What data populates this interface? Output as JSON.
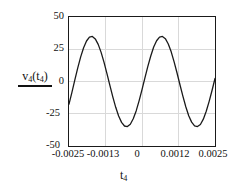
{
  "chart_data": {
    "type": "line",
    "title": "",
    "subtitle": "",
    "xlabel": "t_4",
    "ylabel": "v_4(t_4)",
    "xlabel_parts": {
      "base": "t",
      "sub": "4"
    },
    "ylabel_parts": {
      "base": "v",
      "sub": "4",
      "arg_base": "t",
      "arg_sub": "4"
    },
    "xlim": [
      -0.0025,
      0.0025
    ],
    "ylim": [
      -50,
      50
    ],
    "xticks": [
      -0.0025,
      -0.0013,
      0,
      0.0012,
      0.0025
    ],
    "xtick_labels": [
      "-0.0025",
      "-0.0013",
      "0",
      "0.0012",
      "0.0025"
    ],
    "yticks": [
      50,
      25,
      0,
      -25,
      -50
    ],
    "ytick_labels": [
      "50",
      "25",
      "0",
      "-25",
      "-50"
    ],
    "grid": true,
    "grid_color": "#d9d9d9",
    "line_color": "#1a1a1a",
    "line_width": 1.3,
    "legend": null,
    "legend_position": "none",
    "waveform": {
      "shape": "sinusoid",
      "amplitude": 35,
      "offset": 0,
      "period": 0.0024,
      "frequency_hz": 417,
      "phase_deg": -150,
      "description": "Sinusoidal voltage, amplitude 35 V, about two cycles across the 5 ms window"
    },
    "x": [
      -0.0025,
      -0.0024,
      -0.0023,
      -0.0022,
      -0.0021,
      -0.002,
      -0.0019,
      -0.0018,
      -0.0017,
      -0.0016,
      -0.0015,
      -0.0014,
      -0.0013,
      -0.0012,
      -0.0011,
      -0.001,
      -0.0009,
      -0.0008,
      -0.0007,
      -0.0006,
      -0.0005,
      -0.0004,
      -0.0003,
      -0.0002,
      -0.0001,
      0.0,
      0.0001,
      0.0002,
      0.0003,
      0.0004,
      0.0005,
      0.0006,
      0.0007,
      0.0008,
      0.0009,
      0.001,
      0.0011,
      0.0012,
      0.0013,
      0.0014,
      0.0015,
      0.0016,
      0.0017,
      0.0018,
      0.0019,
      0.002,
      0.0021,
      0.0022,
      0.0023,
      0.0024,
      0.0025
    ],
    "y": [
      -17.5,
      -8.4,
      1.2,
      10.6,
      19.1,
      26.2,
      31.4,
      34.4,
      34.9,
      33.0,
      28.8,
      22.6,
      14.8,
      6.1,
      -3.0,
      -11.9,
      -20.0,
      -26.8,
      -31.7,
      -34.5,
      -34.9,
      -33.1,
      -28.9,
      -22.8,
      -15.0,
      -6.3,
      2.8,
      11.7,
      19.8,
      26.7,
      31.6,
      34.4,
      34.9,
      33.2,
      29.1,
      23.0,
      15.2,
      6.6,
      -2.5,
      -11.4,
      -19.6,
      -26.5,
      -31.5,
      -34.4,
      -34.9,
      -33.3,
      -29.2,
      -23.1,
      -15.4,
      -6.8,
      2.3
    ]
  },
  "labels": {
    "y_axis_title": "v4(t4)",
    "x_axis_title": "t4"
  }
}
